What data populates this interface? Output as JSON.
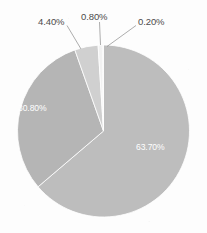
{
  "chart": {
    "title": "",
    "background_color": "#fdfdfd"
  },
  "chart_data": {
    "type": "pie",
    "title": "",
    "subtitle": "",
    "xlabel": "",
    "ylabel": "",
    "legend": "none",
    "grid": false,
    "start_angle_deg": 0,
    "direction": "clockwise",
    "categories": [
      "63.70%",
      "30.80%",
      "4.40%",
      "0.80%",
      "0.20%"
    ],
    "values": [
      63.7,
      30.8,
      4.4,
      0.8,
      0.2
    ],
    "total": 99.9,
    "value_unit": "percent",
    "slices": [
      {
        "label": "63.70%",
        "value": 63.7,
        "color": "#bdbdbd",
        "label_position": "inside",
        "label_color": "#ffffff"
      },
      {
        "label": "30.80%",
        "value": 30.8,
        "color": "#b5b5b5",
        "label_position": "inside",
        "label_color": "#ffffff"
      },
      {
        "label": "4.40%",
        "value": 4.4,
        "color": "#d0d0d0",
        "label_position": "outside",
        "label_color": "#4c4c4c"
      },
      {
        "label": "0.80%",
        "value": 0.8,
        "color": "#f2f2f2",
        "label_position": "outside",
        "label_color": "#4c4c4c"
      },
      {
        "label": "0.20%",
        "value": 0.2,
        "color": "#d8d8d8",
        "label_position": "outside",
        "label_color": "#4c4c4c"
      }
    ]
  }
}
